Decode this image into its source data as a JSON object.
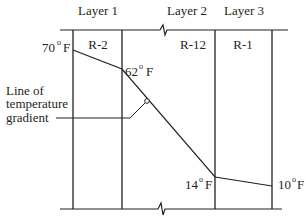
{
  "diagram": {
    "layers": [
      {
        "label": "Layer 1",
        "r_value": "R-2"
      },
      {
        "label": "Layer 2",
        "r_value": "R-12"
      },
      {
        "label": "Layer 3",
        "r_value": "R-1"
      }
    ],
    "temperatures": [
      {
        "value": "70",
        "unit": "F",
        "degree": "o"
      },
      {
        "value": "62",
        "unit": "F",
        "degree": "o"
      },
      {
        "value": "14",
        "unit": "F",
        "degree": "o"
      },
      {
        "value": "10",
        "unit": "F",
        "degree": "o"
      }
    ],
    "callout": {
      "line1": "Line of",
      "line2": "temperature",
      "line3": "gradient"
    },
    "colors": {
      "line": "#231f20",
      "background": "#ffffff"
    }
  }
}
